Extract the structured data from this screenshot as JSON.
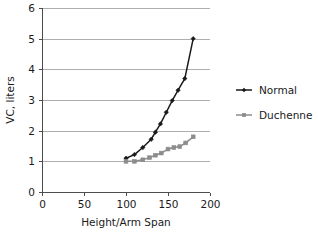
{
  "chart_data": {
    "type": "line",
    "title": "",
    "xlabel": "Height/Arm Span",
    "ylabel": "VC, liters",
    "xlim": [
      0,
      200
    ],
    "ylim": [
      0,
      6
    ],
    "xticks": [
      0,
      50,
      100,
      150,
      200
    ],
    "yticks": [
      0,
      1,
      2,
      3,
      4,
      5,
      6
    ],
    "xtick_labels": [
      "0",
      "50",
      "100",
      "150",
      "200"
    ],
    "ytick_labels": [
      "0",
      "1",
      "2",
      "3",
      "4",
      "5",
      "6"
    ],
    "grid": "horizontal",
    "legend_position": "right",
    "series": [
      {
        "name": "Normal",
        "color": "#1a1a1a",
        "marker": "diamond",
        "x": [
          100,
          110,
          120,
          130,
          135,
          141,
          148,
          155,
          162,
          170,
          180
        ],
        "y": [
          1.1,
          1.22,
          1.45,
          1.72,
          1.95,
          2.22,
          2.6,
          2.98,
          3.32,
          3.7,
          5.0
        ]
      },
      {
        "name": "Duchenne",
        "color": "#8c8c8c",
        "marker": "square",
        "x": [
          100,
          110,
          120,
          128,
          135,
          142,
          150,
          157,
          164,
          171,
          180
        ],
        "y": [
          1.0,
          1.0,
          1.05,
          1.12,
          1.2,
          1.27,
          1.4,
          1.45,
          1.48,
          1.6,
          1.8
        ]
      }
    ]
  },
  "axes": {
    "y_axis_title": "VC, liters",
    "x_axis_title": "Height/Arm Span"
  },
  "legend": {
    "entries": [
      {
        "label": "Normal",
        "color": "#1a1a1a"
      },
      {
        "label": "Duchenne",
        "color": "#8c8c8c"
      }
    ]
  },
  "colors": {
    "normal": "#1a1a1a",
    "duchenne": "#8c8c8c",
    "grid": "#9a9a9a",
    "axis": "#4d4d4d",
    "background": "#ffffff"
  }
}
